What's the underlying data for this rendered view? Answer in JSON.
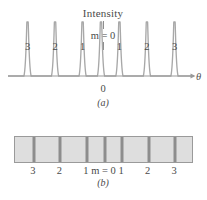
{
  "figure": {
    "panel_a": {
      "caption": "(a)",
      "title": "Intensity",
      "center_order_label": "m = 0",
      "axis_label": "θ",
      "origin_label": "0",
      "peak_labels": [
        "3",
        "2",
        "1",
        "",
        "1",
        "2",
        "3"
      ]
    },
    "panel_b": {
      "caption": "(b)",
      "labels": [
        "3",
        "2",
        "1",
        "m = 0",
        "1",
        "2",
        "3"
      ]
    }
  },
  "chart_data": {
    "type": "line",
    "title": "Intensity",
    "xlabel": "θ",
    "ylabel": "Intensity",
    "subtitle": "Diffraction-grating intensity pattern and corresponding screen fringes",
    "grid": false,
    "legend": null,
    "xlim": [
      -3.6,
      3.6
    ],
    "ylim": [
      0,
      1.05
    ],
    "orders": [
      -3,
      -2,
      -1,
      0,
      1,
      2,
      3
    ],
    "order_labels": [
      "3",
      "2",
      "1",
      "m = 0",
      "1",
      "2",
      "3"
    ],
    "peak_positions_px": [
      49,
      83,
      118,
      153,
      188,
      223,
      258
    ],
    "peak_x_fraction": [
      0.105,
      0.253,
      0.401,
      0.5,
      0.599,
      0.747,
      0.895
    ],
    "peak_heights": [
      1.0,
      1.0,
      1.0,
      1.0,
      1.0,
      1.0,
      1.0
    ],
    "baseline": 0.0,
    "peak_half_width_fraction": 0.009,
    "pedestal_half_width_fraction": 0.022,
    "annotations": [
      {
        "text": "Intensity",
        "x": 0,
        "y": 1.05,
        "role": "axis-title"
      },
      {
        "text": "m = 0",
        "x": 0,
        "y": 0.85,
        "role": "center-order"
      },
      {
        "text": "0",
        "x": 0,
        "y": -0.12,
        "role": "origin"
      },
      {
        "text": "θ",
        "x": 3.55,
        "y": 0.0,
        "role": "axis-arrowhead-label"
      }
    ],
    "screen_fringes": {
      "type": "bar",
      "bar_extent_px": [
        14,
        193
      ],
      "fringe_x_fraction": [
        0.105,
        0.253,
        0.401,
        0.5,
        0.599,
        0.747,
        0.895
      ],
      "fringe_labels": [
        "3",
        "2",
        "1",
        "m = 0",
        "1",
        "2",
        "3"
      ],
      "background_color": "#dedede",
      "fringe_color": "#8d8d8d",
      "border_color": "#9a9a9a"
    }
  },
  "colors": {
    "curve": "#a8a8a8",
    "curve_dark": "#9a9a9a",
    "axis": "#8e8e8e",
    "text": "#4a4a4a",
    "bar_fill": "#dedede",
    "bar_border": "#9a9a9a",
    "fringe": "#8d8d8d",
    "background": "#ffffff"
  }
}
